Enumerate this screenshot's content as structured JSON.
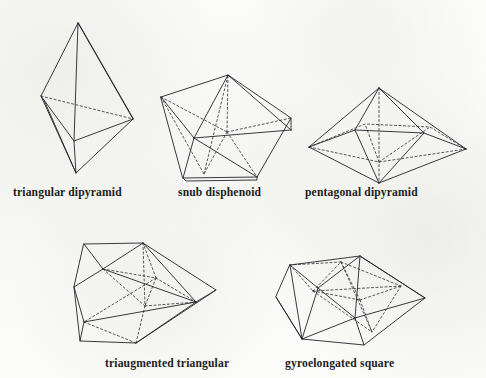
{
  "figure": {
    "kind": "polyhedra-plate",
    "background_color": "#fbfbfa",
    "edge_color": "#24242a",
    "hidden_edge_color": "#3a3a40",
    "label_color": "#1d1d22",
    "rows": [
      {
        "row": 1,
        "items": [
          {
            "label": "triangular dipyramid",
            "solid_name": "triangular-dipyramid"
          },
          {
            "label": "snub disphenoid",
            "solid_name": "snub-disphenoid"
          },
          {
            "label": "pentagonal dipyramid",
            "solid_name": "pentagonal-dipyramid"
          }
        ]
      },
      {
        "row": 2,
        "items": [
          {
            "label": "triaugmented triangular",
            "solid_name": "triaugmented-triangular-prism"
          },
          {
            "label": "gyroelongated square",
            "solid_name": "gyroelongated-square-dipyramid"
          }
        ]
      }
    ],
    "labels": {
      "triangular_dipyramid": "triangular dipyramid",
      "snub_disphenoid": "snub disphenoid",
      "pentagonal_dipyramid": "pentagonal dipyramid",
      "triaugmented_triangular": "triaugmented triangular",
      "gyroelongated_square": "gyroelongated square"
    }
  }
}
